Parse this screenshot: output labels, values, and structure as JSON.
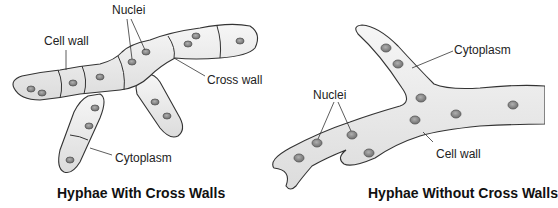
{
  "left_panel": {
    "title": "Hyphae With Cross Walls",
    "labels": {
      "nuclei": "Nuclei",
      "cell_wall": "Cell wall",
      "cross_wall": "Cross wall",
      "cytoplasm": "Cytoplasm"
    }
  },
  "right_panel": {
    "title": "Hyphae Without Cross Walls",
    "labels": {
      "cytoplasm": "Cytoplasm",
      "nuclei": "Nuclei",
      "cell_wall": "Cell wall"
    }
  },
  "colors": {
    "hypha_fill": "#ececec",
    "outline": "#333333",
    "nucleus_fill": "#8a8a8a",
    "nucleus_edge": "#555555"
  }
}
